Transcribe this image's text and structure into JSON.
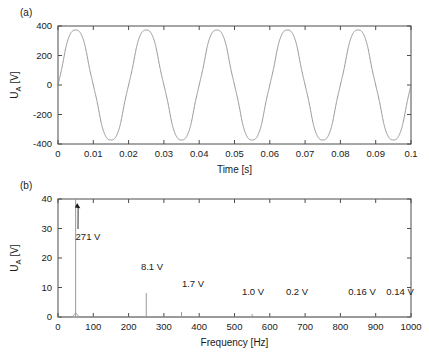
{
  "figure": {
    "panel_a_label": "(a)",
    "panel_b_label": "(b)"
  },
  "chart_data": [
    {
      "id": "panel-a",
      "type": "line",
      "title": "",
      "panel_label": "(a)",
      "xlabel": "Time [s]",
      "ylabel": "U_A [V]",
      "ylabel_main": "U",
      "ylabel_sub": "A",
      "ylabel_unit": " [V]",
      "xlim": [
        0,
        0.1
      ],
      "ylim": [
        -400,
        400
      ],
      "xticks": [
        0,
        0.01,
        0.02,
        0.03,
        0.04,
        0.05,
        0.06,
        0.07,
        0.08,
        0.09,
        0.1
      ],
      "xticklabels": [
        "0",
        "0.01",
        "0.02",
        "0.03",
        "0.04",
        "0.05",
        "0.06",
        "0.07",
        "0.08",
        "0.09",
        "0.1"
      ],
      "yticks": [
        -400,
        -200,
        0,
        200,
        400
      ],
      "yticklabels": [
        "-400",
        "-200",
        "0",
        "200",
        "400"
      ],
      "grid": false,
      "series_name": "U_A(t)",
      "waveform": {
        "description": "distorted sine, 50 Hz fundamental plus harmonics",
        "fundamental_hz": 50,
        "amplitude_v": 383,
        "phase_deg": 0,
        "harmonics": [
          {
            "order": 1,
            "freq_hz": 50,
            "amplitude_v": 383,
            "phase_deg": 0
          },
          {
            "order": 5,
            "freq_hz": 250,
            "amplitude_v": 11.5,
            "phase_deg": 180
          },
          {
            "order": 7,
            "freq_hz": 350,
            "amplitude_v": 2.4,
            "phase_deg": 180
          },
          {
            "order": 11,
            "freq_hz": 550,
            "amplitude_v": 1.4,
            "phase_deg": 0
          },
          {
            "order": 13,
            "freq_hz": 650,
            "amplitude_v": 0.3,
            "phase_deg": 0
          }
        ]
      },
      "line_color": "#8c8c8c"
    },
    {
      "id": "panel-b",
      "type": "bar",
      "title": "",
      "panel_label": "(b)",
      "xlabel": "Frequency [Hz]",
      "ylabel": "U_A [V]",
      "ylabel_main": "U",
      "ylabel_sub": "A",
      "ylabel_unit": " [V]",
      "xlim": [
        0,
        1000
      ],
      "ylim": [
        0,
        40
      ],
      "xticks": [
        0,
        100,
        200,
        300,
        400,
        500,
        600,
        700,
        800,
        900,
        1000
      ],
      "xticklabels": [
        "0",
        "100",
        "200",
        "300",
        "400",
        "500",
        "600",
        "700",
        "800",
        "900",
        "1000"
      ],
      "yticks": [
        0,
        10,
        20,
        30,
        40
      ],
      "yticklabels": [
        "0",
        "10",
        "20",
        "30",
        "40"
      ],
      "grid": false,
      "categories": [
        50,
        250,
        350,
        550,
        650,
        850,
        950
      ],
      "values": [
        271,
        8.1,
        1.7,
        1.0,
        0.2,
        0.16,
        0.14
      ],
      "clip_note": "50 Hz line is clipped at the 40 V axis top",
      "line_color": "#8c8c8c",
      "annotations": [
        {
          "name": "peak-50hz",
          "text": "271 V",
          "freq_hz": 50,
          "value_v": 271,
          "has_arrow": true
        },
        {
          "name": "peak-250hz",
          "text": "8.1 V",
          "freq_hz": 250,
          "value_v": 8.1,
          "has_arrow": false
        },
        {
          "name": "peak-350hz",
          "text": "1.7 V",
          "freq_hz": 350,
          "value_v": 1.7,
          "has_arrow": false
        },
        {
          "name": "peak-550hz",
          "text": "1.0 V",
          "freq_hz": 550,
          "value_v": 1.0,
          "has_arrow": false
        },
        {
          "name": "peak-650hz",
          "text": "0.2 V",
          "freq_hz": 650,
          "value_v": 0.2,
          "has_arrow": false
        },
        {
          "name": "peak-850hz",
          "text": "0.16 V",
          "freq_hz": 850,
          "value_v": 0.16,
          "has_arrow": false
        },
        {
          "name": "peak-950hz",
          "text": "0.14 V",
          "freq_hz": 950,
          "value_v": 0.14,
          "has_arrow": false
        }
      ]
    }
  ]
}
